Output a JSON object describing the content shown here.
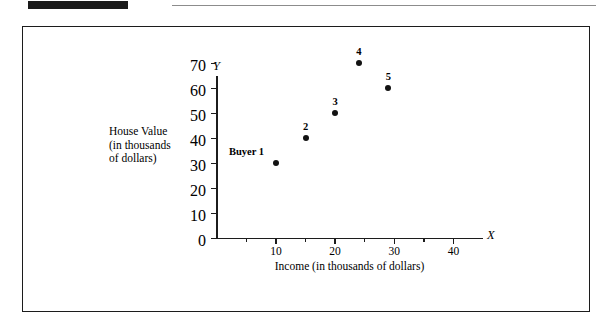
{
  "page": {
    "decorations": {
      "black_bar": "black-bar",
      "horizontal_rule": "horizontal-rule"
    }
  },
  "chart_data": {
    "type": "scatter",
    "title": "",
    "xlabel": "Income (in thousands of dollars)",
    "ylabel": "House Value\n(in thousands\nof dollars)",
    "ylabel_lines": [
      "House Value",
      "(in thousands",
      "of dollars)"
    ],
    "x_axis_letter": "X",
    "y_axis_letter": "Y",
    "xlim": [
      0,
      45
    ],
    "ylim": [
      0,
      75
    ],
    "grid": false,
    "legend": null,
    "x_major_ticks": [
      10,
      20,
      30,
      40
    ],
    "x_minor_ticks": [
      5,
      15,
      25,
      35
    ],
    "x_tick_labels": [
      "10",
      "20",
      "30",
      "40"
    ],
    "y_ticks": [
      0,
      10,
      20,
      30,
      40,
      50,
      60,
      70
    ],
    "y_tick_labels": [
      "0",
      "10",
      "20",
      "30",
      "40",
      "50",
      "60",
      "70"
    ],
    "point_color": "#121212",
    "axis_color": "#1c1c1c",
    "points": [
      {
        "label": "Buyer 1",
        "x": 10,
        "y": 30
      },
      {
        "label": "2",
        "x": 15,
        "y": 40
      },
      {
        "label": "3",
        "x": 20,
        "y": 50
      },
      {
        "label": "4",
        "x": 24,
        "y": 70
      },
      {
        "label": "5",
        "x": 29,
        "y": 60
      }
    ]
  }
}
